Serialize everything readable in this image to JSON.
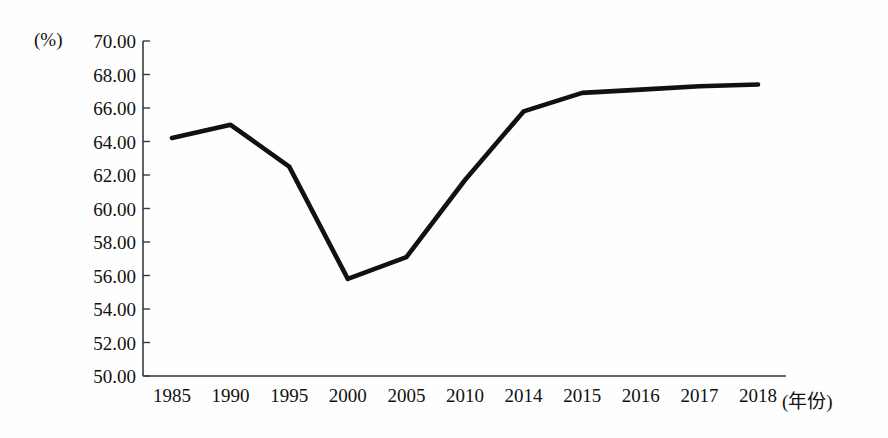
{
  "axes": {
    "unit_label": "(%)",
    "xaxis_title": "(年份)",
    "y_ticks": [
      "70.00",
      "68.00",
      "66.00",
      "64.00",
      "62.00",
      "60.00",
      "58.00",
      "56.00",
      "54.00",
      "52.00",
      "50.00"
    ],
    "x_ticks": [
      "1985",
      "1990",
      "1995",
      "2000",
      "2005",
      "2010",
      "2014",
      "2015",
      "2016",
      "2017",
      "2018"
    ]
  },
  "style": {
    "line_color": "#111111",
    "axis_color": "#3a3a3a",
    "background": "#fefefe"
  },
  "chart_data": {
    "type": "line",
    "title": "",
    "xlabel": "(年份)",
    "ylabel": "(%)",
    "ylim": [
      50.0,
      70.0
    ],
    "ytick_step": 2.0,
    "grid": false,
    "legend": null,
    "categories": [
      "1985",
      "1990",
      "1995",
      "2000",
      "2005",
      "2010",
      "2014",
      "2015",
      "2016",
      "2017",
      "2018"
    ],
    "values": [
      64.2,
      65.0,
      62.5,
      55.8,
      57.1,
      61.7,
      65.8,
      66.9,
      67.1,
      67.3,
      67.4
    ],
    "series": [
      {
        "name": "",
        "values": [
          64.2,
          65.0,
          62.5,
          55.8,
          57.1,
          61.7,
          65.8,
          66.9,
          67.1,
          67.3,
          67.4
        ]
      }
    ],
    "annotations": []
  }
}
